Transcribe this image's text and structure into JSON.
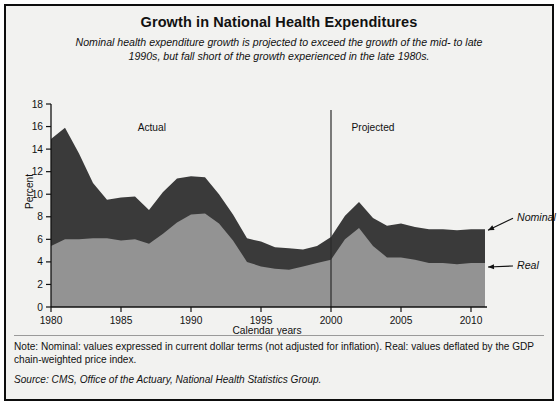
{
  "figure": {
    "title": "Growth in National Health Expenditures",
    "subtitle": "Nominal health expenditure growth is projected to exceed the growth of the mid- to late 1990s, but fall short of the growth experienced in the late 1980s.",
    "note": "Note: Nominal: values expressed in current dollar terms (not adjusted for inflation). Real: values deflated by the GDP chain-weighted price index.",
    "source": "Source: CMS, Office of the Actuary, National Health Statistics Group."
  },
  "colors": {
    "nominal_fill": "#3a3a3a",
    "real_fill": "#939393",
    "background": "#f2f2f0",
    "frame": "#0d0d0d",
    "axis": "#111111"
  },
  "chart_data": {
    "type": "area",
    "title": "Growth in National Health Expenditures",
    "subtitle": "Nominal health expenditure growth is projected to exceed the growth of the mid- to late 1990s, but fall short of the growth experienced in the late 1980s.",
    "xlabel": "Calendar years",
    "ylabel": "Percent",
    "xlim": [
      1980,
      2011
    ],
    "ylim": [
      0,
      18
    ],
    "ytick_step": 2,
    "yticks": [
      0,
      2,
      4,
      6,
      8,
      10,
      12,
      14,
      16,
      18
    ],
    "xticks": [
      1980,
      1985,
      1990,
      1995,
      2000,
      2005,
      2010
    ],
    "grid": false,
    "legend_position": "right-annotated-arrows",
    "stacking": "overlaid",
    "x": [
      1980,
      1981,
      1982,
      1983,
      1984,
      1985,
      1986,
      1987,
      1988,
      1989,
      1990,
      1991,
      1992,
      1993,
      1994,
      1995,
      1996,
      1997,
      1998,
      1999,
      2000,
      2001,
      2002,
      2003,
      2004,
      2005,
      2006,
      2007,
      2008,
      2009,
      2010,
      2011
    ],
    "series": [
      {
        "name": "Nominal",
        "color": "#3a3a3a",
        "values": [
          14.9,
          15.9,
          13.6,
          11.0,
          9.5,
          9.7,
          9.8,
          8.6,
          10.2,
          11.4,
          11.6,
          11.5,
          10.0,
          8.2,
          6.1,
          5.8,
          5.3,
          5.2,
          5.1,
          5.4,
          6.2,
          8.1,
          9.3,
          7.9,
          7.2,
          7.4,
          7.1,
          6.9,
          6.9,
          6.8,
          6.9,
          6.9
        ]
      },
      {
        "name": "Real",
        "color": "#939393",
        "values": [
          5.4,
          6.0,
          6.0,
          6.1,
          6.1,
          5.9,
          6.0,
          5.6,
          6.5,
          7.5,
          8.2,
          8.3,
          7.4,
          5.9,
          4.0,
          3.6,
          3.4,
          3.3,
          3.6,
          3.9,
          4.2,
          6.0,
          7.0,
          5.4,
          4.4,
          4.4,
          4.2,
          3.9,
          3.9,
          3.8,
          3.9,
          3.9
        ]
      }
    ],
    "annotations": [
      {
        "text": "Actual",
        "x": 1987.2,
        "y": 15.6,
        "name": "actual-label"
      },
      {
        "text": "Projected",
        "x": 2003.0,
        "y": 15.6,
        "name": "projected-label"
      }
    ],
    "vertical_rule": {
      "x": 2000,
      "label": "actual-projected-divider"
    },
    "series_callouts": [
      {
        "text": "Nominal",
        "name": "nominal-callout"
      },
      {
        "text": "Real",
        "name": "real-callout"
      }
    ]
  }
}
